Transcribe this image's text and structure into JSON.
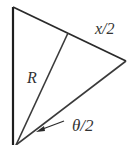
{
  "diagram": {
    "labels": {
      "half_chord": "x/2",
      "radius": "R",
      "half_angle": "θ/2"
    },
    "colors": {
      "stroke": "#2a2a2a",
      "text": "#333333"
    }
  }
}
